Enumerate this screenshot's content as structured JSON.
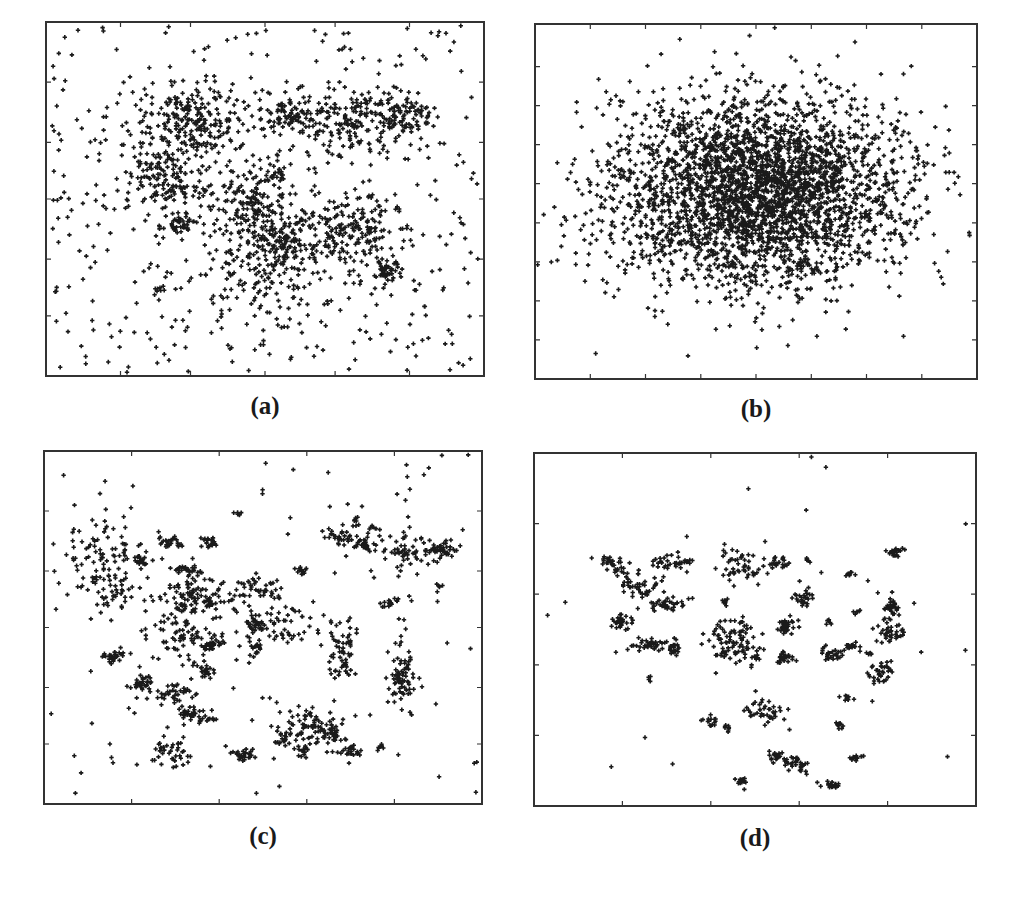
{
  "figure": {
    "background": "#ffffff",
    "frame_color": "#333333",
    "marker_color": "#1a1a1a",
    "marker": "plus"
  },
  "chart_data": [
    {
      "id": "a",
      "type": "scatter",
      "title": "",
      "caption": "(a)",
      "xlabel": "",
      "ylabel": "",
      "xlim": [
        0,
        1
      ],
      "ylim": [
        0,
        1
      ],
      "grid": false,
      "legend": null,
      "tick_labels": false,
      "x_ticks": [
        0.17,
        0.33,
        0.5,
        0.66,
        0.83
      ],
      "y_ticks": [
        0.17,
        0.33,
        0.5,
        0.66,
        0.83
      ],
      "description": "Several overlapping gaussian clusters embedded in broad uniform noise",
      "background_noise": 420,
      "clusters": [
        {
          "x": 0.34,
          "y": 0.72,
          "sx": 0.07,
          "sy": 0.05,
          "n": 220
        },
        {
          "x": 0.27,
          "y": 0.56,
          "sx": 0.05,
          "sy": 0.05,
          "n": 160
        },
        {
          "x": 0.31,
          "y": 0.43,
          "sx": 0.02,
          "sy": 0.015,
          "n": 40
        },
        {
          "x": 0.55,
          "y": 0.74,
          "sx": 0.03,
          "sy": 0.025,
          "n": 70
        },
        {
          "x": 0.72,
          "y": 0.72,
          "sx": 0.07,
          "sy": 0.05,
          "n": 200
        },
        {
          "x": 0.83,
          "y": 0.74,
          "sx": 0.03,
          "sy": 0.025,
          "n": 60
        },
        {
          "x": 0.48,
          "y": 0.48,
          "sx": 0.05,
          "sy": 0.06,
          "n": 180
        },
        {
          "x": 0.54,
          "y": 0.38,
          "sx": 0.03,
          "sy": 0.03,
          "n": 70
        },
        {
          "x": 0.7,
          "y": 0.42,
          "sx": 0.06,
          "sy": 0.05,
          "n": 170
        },
        {
          "x": 0.78,
          "y": 0.3,
          "sx": 0.02,
          "sy": 0.02,
          "n": 50
        },
        {
          "x": 0.52,
          "y": 0.3,
          "sx": 0.1,
          "sy": 0.08,
          "n": 200
        },
        {
          "x": 0.26,
          "y": 0.25,
          "sx": 0.005,
          "sy": 0.005,
          "n": 6
        },
        {
          "x": 0.53,
          "y": 0.57,
          "sx": 0.01,
          "sy": 0.01,
          "n": 12
        }
      ]
    },
    {
      "id": "b",
      "type": "scatter",
      "title": "",
      "caption": "(b)",
      "xlabel": "",
      "ylabel": "",
      "xlim": [
        0,
        1
      ],
      "ylim": [
        0,
        1
      ],
      "grid": false,
      "legend": null,
      "tick_labels": false,
      "x_ticks": [
        0.125,
        0.25,
        0.375,
        0.5,
        0.625,
        0.75,
        0.875
      ],
      "y_ticks": [
        0.11,
        0.22,
        0.33,
        0.44,
        0.55,
        0.66,
        0.77,
        0.88
      ],
      "description": "Single large isotropic gaussian blob centered near the middle",
      "background_noise": 0,
      "clusters": [
        {
          "x": 0.5,
          "y": 0.53,
          "sx": 0.165,
          "sy": 0.135,
          "n": 3200
        }
      ]
    },
    {
      "id": "c",
      "type": "scatter",
      "title": "",
      "caption": "(c)",
      "xlabel": "",
      "ylabel": "",
      "xlim": [
        0,
        1
      ],
      "ylim": [
        0,
        1
      ],
      "grid": false,
      "legend": null,
      "tick_labels": false,
      "x_ticks": [
        0.2,
        0.4,
        0.6,
        0.8
      ],
      "y_ticks": [
        0.17,
        0.33,
        0.5,
        0.66,
        0.83
      ],
      "description": "Many small compact clusters of varying spread with sparse noise",
      "background_noise": 120,
      "clusters": [
        {
          "x": 0.13,
          "y": 0.7,
          "sx": 0.05,
          "sy": 0.06,
          "n": 90
        },
        {
          "x": 0.16,
          "y": 0.6,
          "sx": 0.025,
          "sy": 0.025,
          "n": 30
        },
        {
          "x": 0.22,
          "y": 0.69,
          "sx": 0.01,
          "sy": 0.01,
          "n": 20
        },
        {
          "x": 0.29,
          "y": 0.74,
          "sx": 0.012,
          "sy": 0.008,
          "n": 25
        },
        {
          "x": 0.38,
          "y": 0.74,
          "sx": 0.012,
          "sy": 0.008,
          "n": 25
        },
        {
          "x": 0.33,
          "y": 0.66,
          "sx": 0.015,
          "sy": 0.01,
          "n": 30
        },
        {
          "x": 0.35,
          "y": 0.58,
          "sx": 0.04,
          "sy": 0.03,
          "n": 90
        },
        {
          "x": 0.3,
          "y": 0.48,
          "sx": 0.05,
          "sy": 0.05,
          "n": 80
        },
        {
          "x": 0.38,
          "y": 0.45,
          "sx": 0.012,
          "sy": 0.012,
          "n": 25
        },
        {
          "x": 0.37,
          "y": 0.38,
          "sx": 0.012,
          "sy": 0.012,
          "n": 25
        },
        {
          "x": 0.16,
          "y": 0.42,
          "sx": 0.015,
          "sy": 0.01,
          "n": 30
        },
        {
          "x": 0.22,
          "y": 0.34,
          "sx": 0.015,
          "sy": 0.012,
          "n": 35
        },
        {
          "x": 0.3,
          "y": 0.31,
          "sx": 0.02,
          "sy": 0.015,
          "n": 35
        },
        {
          "x": 0.34,
          "y": 0.26,
          "sx": 0.015,
          "sy": 0.008,
          "n": 25
        },
        {
          "x": 0.37,
          "y": 0.24,
          "sx": 0.015,
          "sy": 0.008,
          "n": 20
        },
        {
          "x": 0.29,
          "y": 0.15,
          "sx": 0.03,
          "sy": 0.02,
          "n": 40
        },
        {
          "x": 0.46,
          "y": 0.14,
          "sx": 0.015,
          "sy": 0.01,
          "n": 30
        },
        {
          "x": 0.48,
          "y": 0.6,
          "sx": 0.04,
          "sy": 0.025,
          "n": 50
        },
        {
          "x": 0.48,
          "y": 0.47,
          "sx": 0.015,
          "sy": 0.04,
          "n": 50
        },
        {
          "x": 0.55,
          "y": 0.51,
          "sx": 0.04,
          "sy": 0.03,
          "n": 40
        },
        {
          "x": 0.44,
          "y": 0.82,
          "sx": 0.005,
          "sy": 0.005,
          "n": 6
        },
        {
          "x": 0.59,
          "y": 0.66,
          "sx": 0.008,
          "sy": 0.008,
          "n": 12
        },
        {
          "x": 0.61,
          "y": 0.22,
          "sx": 0.04,
          "sy": 0.03,
          "n": 90
        },
        {
          "x": 0.55,
          "y": 0.18,
          "sx": 0.01,
          "sy": 0.01,
          "n": 15
        },
        {
          "x": 0.59,
          "y": 0.15,
          "sx": 0.01,
          "sy": 0.008,
          "n": 15
        },
        {
          "x": 0.66,
          "y": 0.2,
          "sx": 0.01,
          "sy": 0.01,
          "n": 15
        },
        {
          "x": 0.7,
          "y": 0.15,
          "sx": 0.012,
          "sy": 0.008,
          "n": 20
        },
        {
          "x": 0.68,
          "y": 0.44,
          "sx": 0.02,
          "sy": 0.05,
          "n": 60
        },
        {
          "x": 0.67,
          "y": 0.76,
          "sx": 0.015,
          "sy": 0.01,
          "n": 25
        },
        {
          "x": 0.72,
          "y": 0.74,
          "sx": 0.015,
          "sy": 0.012,
          "n": 30
        },
        {
          "x": 0.71,
          "y": 0.8,
          "sx": 0.006,
          "sy": 0.006,
          "n": 8
        },
        {
          "x": 0.75,
          "y": 0.78,
          "sx": 0.006,
          "sy": 0.006,
          "n": 8
        },
        {
          "x": 0.82,
          "y": 0.72,
          "sx": 0.05,
          "sy": 0.025,
          "n": 60
        },
        {
          "x": 0.91,
          "y": 0.72,
          "sx": 0.02,
          "sy": 0.015,
          "n": 40
        },
        {
          "x": 0.79,
          "y": 0.57,
          "sx": 0.01,
          "sy": 0.008,
          "n": 15
        },
        {
          "x": 0.82,
          "y": 0.37,
          "sx": 0.015,
          "sy": 0.05,
          "n": 70
        },
        {
          "x": 0.77,
          "y": 0.16,
          "sx": 0.006,
          "sy": 0.006,
          "n": 8
        },
        {
          "x": 0.9,
          "y": 0.62,
          "sx": 0.005,
          "sy": 0.005,
          "n": 6
        }
      ]
    },
    {
      "id": "d",
      "type": "scatter",
      "title": "",
      "caption": "(d)",
      "xlabel": "",
      "ylabel": "",
      "xlim": [
        0,
        1
      ],
      "ylim": [
        0,
        1
      ],
      "grid": false,
      "legend": null,
      "tick_labels": false,
      "x_ticks": [
        0.2,
        0.4,
        0.6,
        0.8
      ],
      "y_ticks": [
        0.2,
        0.4,
        0.6,
        0.8
      ],
      "description": "Many small, well separated compact clusters with very little noise",
      "background_noise": 30,
      "clusters": [
        {
          "x": 0.18,
          "y": 0.68,
          "sx": 0.015,
          "sy": 0.015,
          "n": 35
        },
        {
          "x": 0.24,
          "y": 0.62,
          "sx": 0.02,
          "sy": 0.025,
          "n": 45
        },
        {
          "x": 0.31,
          "y": 0.69,
          "sx": 0.03,
          "sy": 0.015,
          "n": 35
        },
        {
          "x": 0.3,
          "y": 0.57,
          "sx": 0.02,
          "sy": 0.01,
          "n": 35
        },
        {
          "x": 0.2,
          "y": 0.52,
          "sx": 0.012,
          "sy": 0.012,
          "n": 30
        },
        {
          "x": 0.26,
          "y": 0.46,
          "sx": 0.015,
          "sy": 0.01,
          "n": 30
        },
        {
          "x": 0.31,
          "y": 0.45,
          "sx": 0.015,
          "sy": 0.015,
          "n": 25
        },
        {
          "x": 0.22,
          "y": 0.45,
          "sx": 0.004,
          "sy": 0.004,
          "n": 4
        },
        {
          "x": 0.26,
          "y": 0.36,
          "sx": 0.004,
          "sy": 0.004,
          "n": 4
        },
        {
          "x": 0.47,
          "y": 0.68,
          "sx": 0.025,
          "sy": 0.025,
          "n": 50
        },
        {
          "x": 0.55,
          "y": 0.69,
          "sx": 0.012,
          "sy": 0.008,
          "n": 25
        },
        {
          "x": 0.43,
          "y": 0.58,
          "sx": 0.005,
          "sy": 0.005,
          "n": 6
        },
        {
          "x": 0.61,
          "y": 0.59,
          "sx": 0.012,
          "sy": 0.01,
          "n": 25
        },
        {
          "x": 0.62,
          "y": 0.7,
          "sx": 0.005,
          "sy": 0.005,
          "n": 6
        },
        {
          "x": 0.45,
          "y": 0.47,
          "sx": 0.03,
          "sy": 0.035,
          "n": 90
        },
        {
          "x": 0.57,
          "y": 0.51,
          "sx": 0.015,
          "sy": 0.01,
          "n": 30
        },
        {
          "x": 0.57,
          "y": 0.42,
          "sx": 0.012,
          "sy": 0.01,
          "n": 25
        },
        {
          "x": 0.5,
          "y": 0.42,
          "sx": 0.006,
          "sy": 0.006,
          "n": 8
        },
        {
          "x": 0.52,
          "y": 0.27,
          "sx": 0.02,
          "sy": 0.02,
          "n": 40
        },
        {
          "x": 0.4,
          "y": 0.24,
          "sx": 0.01,
          "sy": 0.008,
          "n": 15
        },
        {
          "x": 0.44,
          "y": 0.22,
          "sx": 0.006,
          "sy": 0.006,
          "n": 8
        },
        {
          "x": 0.55,
          "y": 0.14,
          "sx": 0.01,
          "sy": 0.008,
          "n": 20
        },
        {
          "x": 0.59,
          "y": 0.12,
          "sx": 0.015,
          "sy": 0.012,
          "n": 30
        },
        {
          "x": 0.47,
          "y": 0.07,
          "sx": 0.008,
          "sy": 0.008,
          "n": 15
        },
        {
          "x": 0.67,
          "y": 0.06,
          "sx": 0.012,
          "sy": 0.006,
          "n": 20
        },
        {
          "x": 0.73,
          "y": 0.14,
          "sx": 0.008,
          "sy": 0.006,
          "n": 12
        },
        {
          "x": 0.69,
          "y": 0.23,
          "sx": 0.006,
          "sy": 0.006,
          "n": 10
        },
        {
          "x": 0.71,
          "y": 0.31,
          "sx": 0.006,
          "sy": 0.006,
          "n": 10
        },
        {
          "x": 0.67,
          "y": 0.43,
          "sx": 0.012,
          "sy": 0.01,
          "n": 25
        },
        {
          "x": 0.72,
          "y": 0.45,
          "sx": 0.012,
          "sy": 0.006,
          "n": 15
        },
        {
          "x": 0.78,
          "y": 0.37,
          "sx": 0.015,
          "sy": 0.015,
          "n": 30
        },
        {
          "x": 0.81,
          "y": 0.56,
          "sx": 0.012,
          "sy": 0.02,
          "n": 30
        },
        {
          "x": 0.81,
          "y": 0.49,
          "sx": 0.02,
          "sy": 0.015,
          "n": 35
        },
        {
          "x": 0.82,
          "y": 0.72,
          "sx": 0.012,
          "sy": 0.008,
          "n": 25
        },
        {
          "x": 0.72,
          "y": 0.66,
          "sx": 0.006,
          "sy": 0.006,
          "n": 8
        },
        {
          "x": 0.73,
          "y": 0.55,
          "sx": 0.005,
          "sy": 0.005,
          "n": 6
        },
        {
          "x": 0.67,
          "y": 0.52,
          "sx": 0.005,
          "sy": 0.005,
          "n": 6
        },
        {
          "x": 0.76,
          "y": 0.43,
          "sx": 0.005,
          "sy": 0.005,
          "n": 6
        },
        {
          "x": 0.8,
          "y": 0.4,
          "sx": 0.005,
          "sy": 0.005,
          "n": 6
        }
      ]
    }
  ],
  "layout": {
    "panels": [
      {
        "id": "a",
        "left": 46,
        "top": 22,
        "width": 438,
        "height": 354,
        "caption_top": 392
      },
      {
        "id": "b",
        "left": 535,
        "top": 24,
        "width": 442,
        "height": 355,
        "caption_top": 395
      },
      {
        "id": "c",
        "left": 44,
        "top": 451,
        "width": 438,
        "height": 353,
        "caption_top": 822
      },
      {
        "id": "d",
        "left": 534,
        "top": 453,
        "width": 442,
        "height": 353,
        "caption_top": 824
      }
    ]
  }
}
